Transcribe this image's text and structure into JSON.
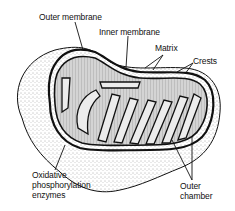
{
  "diagram": {
    "labels": {
      "outer_membrane": "Outer membrane",
      "inner_membrane": "Inner membrane",
      "matrix": "Matrix",
      "crests": "Crests",
      "oxidative_line1": "Oxidative",
      "oxidative_line2": "phosphorylation",
      "oxidative_line3": "enzymes",
      "outer_chamber_line1": "Outer",
      "outer_chamber_line2": "chamber"
    },
    "colors": {
      "ink": "#111111",
      "stipple": "#bdbdbd",
      "matrix_fill": "#cfcfcf",
      "background": "#ffffff"
    }
  }
}
